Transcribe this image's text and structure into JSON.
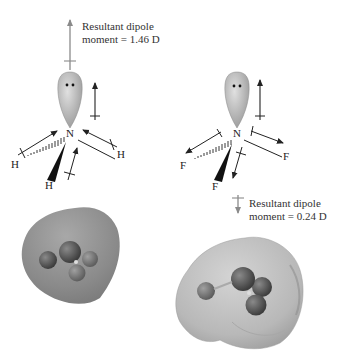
{
  "left_molecule": {
    "name": "NH3",
    "central_atom": "N",
    "substituents": [
      "H",
      "H",
      "H"
    ],
    "resultant_label_line1": "Resultant dipole",
    "resultant_label_line2": "moment = 1.46 D",
    "dipole_value_D": 1.46,
    "resultant_direction": "up"
  },
  "right_molecule": {
    "name": "NF3",
    "central_atom": "N",
    "substituents": [
      "F",
      "F",
      "F"
    ],
    "resultant_label_line1": "Resultant dipole",
    "resultant_label_line2": "moment = 0.24 D",
    "dipole_value_D": 0.24,
    "resultant_direction": "down"
  },
  "colors": {
    "arrow_dark": "#222222",
    "arrow_resultant": "#8a8a8a",
    "lone_pair_lobe": "#b8b8b8",
    "surface": "#8c8c8c",
    "atom_ball": "#5a5a5a"
  }
}
